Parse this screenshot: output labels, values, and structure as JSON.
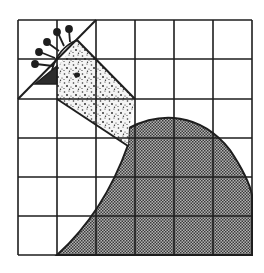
{
  "diagram": {
    "type": "quilt-block-pattern",
    "grid": {
      "columns": 6,
      "rows": 6,
      "x_lines": [
        18,
        57,
        96,
        135,
        174,
        213,
        252
      ],
      "y_lines": [
        20,
        59,
        99,
        138,
        177,
        216,
        255
      ]
    },
    "colors": {
      "ink": "#1e1e1e",
      "background": "#ffffff",
      "body_fill": "#8a8a8a",
      "neck_fill": "#f2f2f2",
      "beak_fill": "#2c2c2c"
    },
    "regions": [
      {
        "name": "body",
        "fill_pattern": "fine-checker"
      },
      {
        "name": "neck",
        "fill_pattern": "stipple-dots"
      },
      {
        "name": "beak",
        "fill_pattern": "solid-dark"
      },
      {
        "name": "comb",
        "fill_pattern": "line-with-dots"
      }
    ]
  }
}
